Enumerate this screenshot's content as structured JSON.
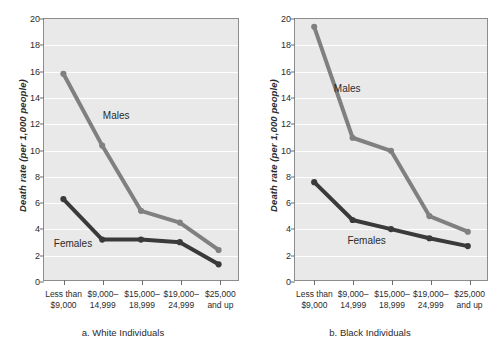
{
  "figure": {
    "panels": [
      {
        "id": "a",
        "caption": "a. White Individuals",
        "ylabel": "Death rate (per 1,000 people)",
        "males_label": "Males",
        "females_label": "Females"
      },
      {
        "id": "b",
        "caption": "b. Black Individuals",
        "ylabel": "Death rate (per 1,000 people)",
        "males_label": "Males",
        "females_label": "Females"
      }
    ],
    "colors": {
      "males": "#808080",
      "females": "#3a3a3a",
      "plot_background": "#e9e9e9",
      "gridline": "#ffffff",
      "frame": "#8d8d8d",
      "text": "#2b2b2b",
      "page_background": "#ffffff"
    }
  },
  "chart_data": [
    {
      "type": "line",
      "title": "a. White Individuals",
      "xlabel": "",
      "ylabel": "Death rate (per 1,000 people)",
      "categories": [
        "Less than\n$9,000",
        "$9,000–\n14,999",
        "$15,000–\n18,999",
        "$19,000–\n24,999",
        "$25,000\nand up"
      ],
      "yticks": [
        0,
        2,
        4,
        6,
        8,
        10,
        12,
        14,
        16,
        18,
        20
      ],
      "ylim": [
        0,
        20
      ],
      "grid": true,
      "legend": "inline-labels",
      "series": [
        {
          "name": "Males",
          "color": "#808080",
          "values": [
            15.8,
            10.3,
            5.3,
            4.4,
            2.3
          ]
        },
        {
          "name": "Females",
          "color": "#3a3a3a",
          "values": [
            6.2,
            3.1,
            3.1,
            2.9,
            1.2
          ]
        }
      ]
    },
    {
      "type": "line",
      "title": "b. Black Individuals",
      "xlabel": "",
      "ylabel": "Death rate (per 1,000 people)",
      "categories": [
        "Less than\n$9,000",
        "$9,000–\n14,999",
        "$15,000–\n18,999",
        "$19,000–\n24,999",
        "$25,000\nand up"
      ],
      "yticks": [
        0,
        2,
        4,
        6,
        8,
        10,
        12,
        14,
        16,
        18,
        20
      ],
      "ylim": [
        0,
        20
      ],
      "grid": true,
      "legend": "inline-labels",
      "series": [
        {
          "name": "Males",
          "color": "#808080",
          "values": [
            19.4,
            10.9,
            9.9,
            4.9,
            3.7
          ]
        },
        {
          "name": "Females",
          "color": "#3a3a3a",
          "values": [
            7.5,
            4.6,
            3.9,
            3.2,
            2.6
          ]
        }
      ]
    }
  ],
  "annotations": {
    "panel_a": {
      "males_label_pos": {
        "x_pct": 30,
        "y_val": 12.6
      },
      "females_label_pos": {
        "x_pct": 5,
        "y_val": 2.9
      }
    },
    "panel_b": {
      "males_label_pos": {
        "x_pct": 20,
        "y_val": 14.7
      },
      "females_label_pos": {
        "x_pct": 27,
        "y_val": 3.1
      }
    }
  }
}
